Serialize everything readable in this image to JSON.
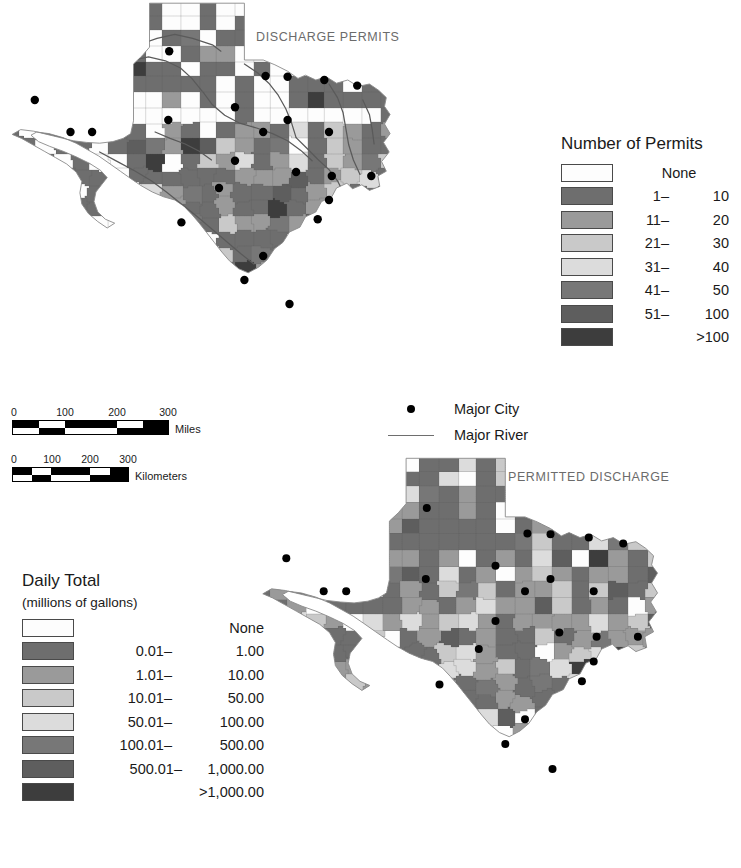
{
  "figure": {
    "background": "#ffffff",
    "maps": [
      {
        "id": "discharge-permits",
        "title": "DISCHARGE PERMITS"
      },
      {
        "id": "permitted-discharge",
        "title": "PERMITTED DISCHARGE"
      }
    ]
  },
  "permits_legend": {
    "title": "Number of Permits",
    "items": [
      {
        "label": "None",
        "lo": "",
        "hi": "",
        "color": "#fdfdfd"
      },
      {
        "label": "",
        "lo": "1–",
        "hi": "10",
        "color": "#6e6e6e"
      },
      {
        "label": "",
        "lo": "11–",
        "hi": "20",
        "color": "#9a9a9a"
      },
      {
        "label": "",
        "lo": "21–",
        "hi": "30",
        "color": "#c9c9c9"
      },
      {
        "label": "",
        "lo": "31–",
        "hi": "40",
        "color": "#dcdcdc"
      },
      {
        "label": "",
        "lo": "41–",
        "hi": "50",
        "color": "#777777"
      },
      {
        "label": "",
        "lo": "51–",
        "hi": "100",
        "color": "#5e5e5e"
      },
      {
        "label": ">100",
        "lo": "",
        "hi": "",
        "color": "#3d3d3d"
      }
    ]
  },
  "daily_legend": {
    "title": "Daily Total",
    "subtitle": "(millions of gallons)",
    "items": [
      {
        "label": "None",
        "lo": "",
        "hi": "",
        "color": "#fdfdfd"
      },
      {
        "label": "",
        "lo": "0.01–",
        "hi": "1.00",
        "color": "#6e6e6e"
      },
      {
        "label": "",
        "lo": "1.01–",
        "hi": "10.00",
        "color": "#9a9a9a"
      },
      {
        "label": "",
        "lo": "10.01–",
        "hi": "50.00",
        "color": "#c9c9c9"
      },
      {
        "label": "",
        "lo": "50.01–",
        "hi": "100.00",
        "color": "#dcdcdc"
      },
      {
        "label": "",
        "lo": "100.01–",
        "hi": "500.00",
        "color": "#777777"
      },
      {
        "label": "",
        "lo": "500.01–",
        "hi": "1,000.00",
        "color": "#5e5e5e"
      },
      {
        "label": ">1,000.00",
        "lo": "",
        "hi": "",
        "color": "#3d3d3d"
      }
    ]
  },
  "symbol_key": {
    "city": {
      "label": "Major City",
      "symbol": "filled-circle",
      "color": "#000000"
    },
    "river": {
      "label": "Major River",
      "symbol": "line",
      "color": "#6e6e6e"
    }
  },
  "scale_bars": [
    {
      "unit": "Miles",
      "ticks": [
        "0",
        "100",
        "200",
        "300"
      ],
      "length_px": 155
    },
    {
      "unit": "Kilometers",
      "ticks": [
        "0",
        "100",
        "200",
        "300"
      ],
      "length_px": 113
    }
  ],
  "chart_data": {
    "type": "choropleth-map",
    "panels": [
      {
        "name": "DISCHARGE PERMITS",
        "variable": "Number of Permits",
        "classes": [
          "None",
          "1–10",
          "11–20",
          "21–30",
          "31–40",
          "41–50",
          "51–100",
          ">100"
        ],
        "colors": [
          "#fdfdfd",
          "#6e6e6e",
          "#9a9a9a",
          "#c9c9c9",
          "#dcdcdc",
          "#777777",
          "#5e5e5e",
          "#3d3d3d"
        ]
      },
      {
        "name": "PERMITTED DISCHARGE",
        "variable": "Daily Total (millions of gallons)",
        "classes": [
          "None",
          "0.01–1.00",
          "1.01–10.00",
          "10.01–50.00",
          "50.01–100.00",
          "100.01–500.00",
          "500.01–1,000.00",
          ">1,000.00"
        ],
        "colors": [
          "#fdfdfd",
          "#6e6e6e",
          "#9a9a9a",
          "#c9c9c9",
          "#dcdcdc",
          "#777777",
          "#5e5e5e",
          "#3d3d3d"
        ]
      }
    ],
    "overlays": [
      "Major City",
      "Major River"
    ],
    "scale_units": [
      "Miles",
      "Kilometers"
    ]
  }
}
